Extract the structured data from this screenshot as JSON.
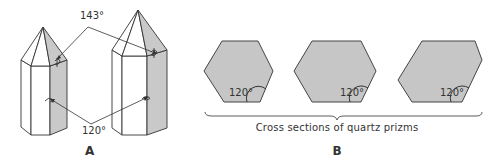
{
  "colors": {
    "shade": "#c9c9c9",
    "hex_fill": "#c6c6c6",
    "line": "#333333",
    "background": "#ffffff"
  },
  "panel_a": {
    "label": "A",
    "crystals": [
      {
        "name": "short-crystal"
      },
      {
        "name": "tall-crystal"
      }
    ],
    "angle_top": "143°",
    "angle_side": "120°"
  },
  "panel_b": {
    "label": "B",
    "hexagons": [
      {
        "angle_label": "120°"
      },
      {
        "angle_label": "120°"
      },
      {
        "angle_label": "120°"
      }
    ],
    "caption": "Cross sections of quartz prizms"
  }
}
